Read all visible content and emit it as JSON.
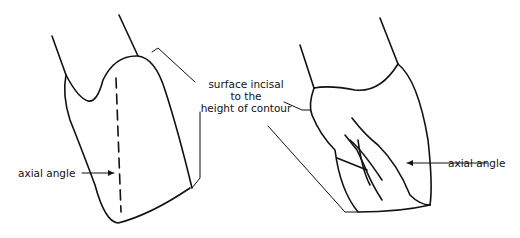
{
  "labels": {
    "left_axial": "axial angle",
    "center_line1": "surface incisal",
    "center_line2": "to the",
    "center_line3": "height of contour",
    "right_axial": "axial angle"
  },
  "colors": {
    "stroke": "#111111",
    "background": "#ffffff"
  }
}
